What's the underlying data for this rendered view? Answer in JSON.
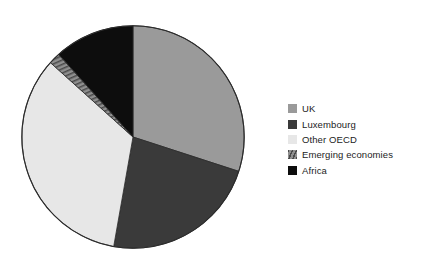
{
  "chart_data": {
    "type": "pie",
    "title": "",
    "labels": [
      "UK",
      "Luxembourg",
      "Other OECD",
      "Emerging economies",
      "Africa"
    ],
    "values": [
      30,
      22.8,
      33.9,
      1.7,
      11.6
    ],
    "units": "percent",
    "start_angle_deg": 0,
    "direction": "clockwise",
    "legend_position": "right",
    "grid": false,
    "slices": [
      {
        "label": "UK",
        "value": 30,
        "color": "#9a9a9a",
        "pattern": "solid",
        "start_deg": 0,
        "end_deg": 108
      },
      {
        "label": "Luxembourg",
        "value": 22.8,
        "color": "#3a3a3a",
        "pattern": "solid",
        "start_deg": 108,
        "end_deg": 190
      },
      {
        "label": "Other OECD",
        "value": 33.9,
        "color": "#e7e7e7",
        "pattern": "solid",
        "start_deg": 190,
        "end_deg": 312
      },
      {
        "label": "Emerging economies",
        "value": 1.7,
        "color": "#8c8c8c",
        "pattern": "hatched",
        "start_deg": 312,
        "end_deg": 318
      },
      {
        "label": "Africa",
        "value": 11.6,
        "color": "#0d0d0d",
        "pattern": "solid",
        "start_deg": 318,
        "end_deg": 360
      }
    ],
    "outline_color": "#2b2b2b"
  },
  "legend": {
    "items": [
      {
        "label": "UK",
        "swatch": "legend-swatch-uk"
      },
      {
        "label": "Luxembourg",
        "swatch": "legend-swatch-luxembourg"
      },
      {
        "label": "Other OECD",
        "swatch": "legend-swatch-other-oecd"
      },
      {
        "label": "Emerging economies",
        "swatch": "legend-swatch-emerging-economies"
      },
      {
        "label": "Africa",
        "swatch": "legend-swatch-africa"
      }
    ]
  }
}
